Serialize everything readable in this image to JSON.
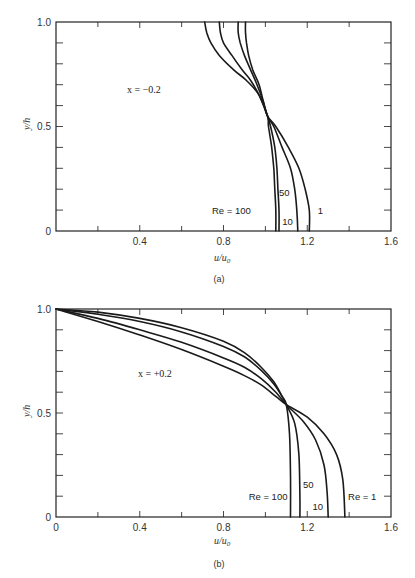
{
  "chart_data": [
    {
      "id": "a",
      "type": "line",
      "caption": "(a)",
      "annotation": "x = −0.2",
      "xlabel": "u/u0",
      "ylabel": "y/h",
      "xlim": [
        0,
        1.6
      ],
      "ylim": [
        0,
        1.0
      ],
      "xticks": [
        0,
        0.2,
        0.4,
        0.6,
        0.8,
        1.0,
        1.2,
        1.4,
        1.6
      ],
      "xtick_labels": [
        {
          "v": 0.4,
          "t": "0.4"
        },
        {
          "v": 0.8,
          "t": "0.8"
        },
        {
          "v": 1.2,
          "t": "1.2"
        },
        {
          "v": 1.6,
          "t": "1.6"
        }
      ],
      "yticks": [
        0,
        0.1,
        0.2,
        0.3,
        0.4,
        0.5,
        0.6,
        0.7,
        0.8,
        0.9,
        1.0
      ],
      "ytick_labels": [
        {
          "v": 0,
          "t": "0"
        },
        {
          "v": 0.5,
          "t": "0.5"
        },
        {
          "v": 1.0,
          "t": "1.0"
        }
      ],
      "grid": false,
      "series": [
        {
          "name": "Re = 100",
          "points": [
            [
              1.05,
              0
            ],
            [
              1.05,
              0.1
            ],
            [
              1.045,
              0.2
            ],
            [
              1.04,
              0.3
            ],
            [
              1.03,
              0.4
            ],
            [
              1.015,
              0.5
            ],
            [
              1.01,
              0.55
            ],
            [
              0.97,
              0.65
            ],
            [
              0.91,
              0.72
            ],
            [
              0.85,
              0.77
            ],
            [
              0.78,
              0.84
            ],
            [
              0.74,
              0.9
            ],
            [
              0.72,
              0.95
            ],
            [
              0.71,
              1.0
            ]
          ]
        },
        {
          "name": "50",
          "points": [
            [
              1.065,
              0
            ],
            [
              1.065,
              0.1
            ],
            [
              1.06,
              0.2
            ],
            [
              1.055,
              0.3
            ],
            [
              1.045,
              0.4
            ],
            [
              1.025,
              0.5
            ],
            [
              1.01,
              0.55
            ],
            [
              0.97,
              0.65
            ],
            [
              0.93,
              0.72
            ],
            [
              0.89,
              0.77
            ],
            [
              0.84,
              0.84
            ],
            [
              0.8,
              0.9
            ],
            [
              0.785,
              0.95
            ],
            [
              0.78,
              1.0
            ]
          ]
        },
        {
          "name": "10",
          "points": [
            [
              1.155,
              0
            ],
            [
              1.15,
              0.1
            ],
            [
              1.14,
              0.2
            ],
            [
              1.12,
              0.3
            ],
            [
              1.08,
              0.4
            ],
            [
              1.04,
              0.5
            ],
            [
              1.01,
              0.55
            ],
            [
              0.99,
              0.62
            ],
            [
              0.96,
              0.7
            ],
            [
              0.93,
              0.77
            ],
            [
              0.9,
              0.84
            ],
            [
              0.88,
              0.9
            ],
            [
              0.87,
              0.95
            ],
            [
              0.87,
              1.0
            ]
          ]
        },
        {
          "name": "1",
          "points": [
            [
              1.21,
              0
            ],
            [
              1.21,
              0.1
            ],
            [
              1.19,
              0.2
            ],
            [
              1.16,
              0.3
            ],
            [
              1.11,
              0.4
            ],
            [
              1.05,
              0.5
            ],
            [
              1.01,
              0.55
            ],
            [
              0.99,
              0.62
            ],
            [
              0.97,
              0.7
            ],
            [
              0.94,
              0.77
            ],
            [
              0.92,
              0.84
            ],
            [
              0.91,
              0.9
            ],
            [
              0.905,
              0.95
            ],
            [
              0.905,
              1.0
            ]
          ]
        }
      ],
      "labels": [
        {
          "text": "Re = 100",
          "x": 0.745,
          "y": 0.095
        },
        {
          "text": "50",
          "x": 1.065,
          "y": 0.18
        },
        {
          "text": "10",
          "x": 1.08,
          "y": 0.045
        },
        {
          "text": "1",
          "x": 1.25,
          "y": 0.095
        }
      ]
    },
    {
      "id": "b",
      "type": "line",
      "caption": "(b)",
      "annotation": "x = +0.2",
      "xlabel": "u/u0",
      "ylabel": "y/h",
      "xlim": [
        0,
        1.6
      ],
      "ylim": [
        0,
        1.0
      ],
      "xticks": [
        0,
        0.2,
        0.4,
        0.6,
        0.8,
        1.0,
        1.2,
        1.4,
        1.6
      ],
      "xtick_labels": [
        {
          "v": 0,
          "t": "0"
        },
        {
          "v": 0.4,
          "t": "0.4"
        },
        {
          "v": 0.8,
          "t": "0.8"
        },
        {
          "v": 1.2,
          "t": "1.2"
        },
        {
          "v": 1.6,
          "t": "1.6"
        }
      ],
      "yticks": [
        0,
        0.1,
        0.2,
        0.3,
        0.4,
        0.5,
        0.6,
        0.7,
        0.8,
        0.9,
        1.0
      ],
      "ytick_labels": [
        {
          "v": 0,
          "t": "0"
        },
        {
          "v": 0.5,
          "t": "0.5"
        },
        {
          "v": 1.0,
          "t": "1.0"
        }
      ],
      "grid": false,
      "series": [
        {
          "name": "Re = 100",
          "points": [
            [
              0,
              1.0
            ],
            [
              0.2,
              0.985
            ],
            [
              0.4,
              0.955
            ],
            [
              0.6,
              0.91
            ],
            [
              0.8,
              0.845
            ],
            [
              0.9,
              0.79
            ],
            [
              0.98,
              0.72
            ],
            [
              1.04,
              0.65
            ],
            [
              1.08,
              0.58
            ],
            [
              1.1,
              0.54
            ],
            [
              1.115,
              0.4
            ],
            [
              1.12,
              0.2
            ],
            [
              1.12,
              0
            ]
          ]
        },
        {
          "name": "50",
          "points": [
            [
              0,
              1.0
            ],
            [
              0.2,
              0.975
            ],
            [
              0.4,
              0.94
            ],
            [
              0.6,
              0.89
            ],
            [
              0.8,
              0.82
            ],
            [
              0.9,
              0.77
            ],
            [
              0.98,
              0.705
            ],
            [
              1.04,
              0.64
            ],
            [
              1.08,
              0.58
            ],
            [
              1.1,
              0.54
            ],
            [
              1.14,
              0.45
            ],
            [
              1.16,
              0.3
            ],
            [
              1.165,
              0.1
            ],
            [
              1.165,
              0
            ]
          ]
        },
        {
          "name": "10",
          "points": [
            [
              0,
              1.0
            ],
            [
              0.2,
              0.955
            ],
            [
              0.4,
              0.9
            ],
            [
              0.6,
              0.84
            ],
            [
              0.8,
              0.765
            ],
            [
              0.9,
              0.72
            ],
            [
              0.98,
              0.665
            ],
            [
              1.05,
              0.6
            ],
            [
              1.1,
              0.54
            ],
            [
              1.18,
              0.46
            ],
            [
              1.24,
              0.37
            ],
            [
              1.28,
              0.25
            ],
            [
              1.295,
              0.12
            ],
            [
              1.3,
              0
            ]
          ]
        },
        {
          "name": "1",
          "points": [
            [
              0,
              1.0
            ],
            [
              0.2,
              0.94
            ],
            [
              0.4,
              0.875
            ],
            [
              0.6,
              0.805
            ],
            [
              0.8,
              0.725
            ],
            [
              0.9,
              0.68
            ],
            [
              0.98,
              0.635
            ],
            [
              1.05,
              0.58
            ],
            [
              1.1,
              0.54
            ],
            [
              1.2,
              0.48
            ],
            [
              1.28,
              0.4
            ],
            [
              1.34,
              0.3
            ],
            [
              1.37,
              0.18
            ],
            [
              1.38,
              0
            ]
          ]
        }
      ],
      "labels": [
        {
          "text": "Re = 100",
          "x": 0.92,
          "y": 0.095
        },
        {
          "text": "50",
          "x": 1.18,
          "y": 0.155
        },
        {
          "text": "10",
          "x": 1.225,
          "y": 0.05
        },
        {
          "text": "Re = 1",
          "x": 1.395,
          "y": 0.095
        }
      ]
    }
  ],
  "figure": {
    "panels": [
      {
        "annotation": "x = −0.2",
        "caption": "(a)",
        "xlabel": "u/u0",
        "ylabel": "y/h"
      },
      {
        "annotation": "x = +0.2",
        "caption": "(b)",
        "xlabel": "u/u0",
        "ylabel": "y/h"
      }
    ],
    "line_color": "#1a1a1a",
    "frame_color": "#222222"
  }
}
